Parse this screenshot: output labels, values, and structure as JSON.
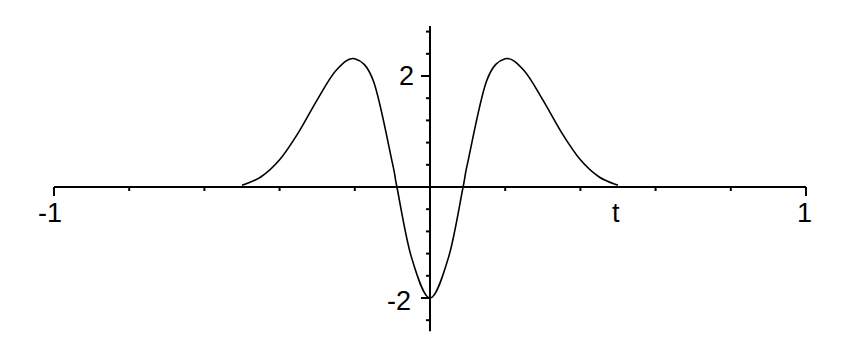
{
  "chart_data": {
    "type": "line",
    "title": "",
    "xlabel": "t",
    "ylabel": "",
    "xlim": [
      -1,
      1
    ],
    "ylim": [
      -2.6,
      2.9
    ],
    "grid": false,
    "legend": null,
    "x_tick_labels": [
      "-1",
      "1"
    ],
    "y_tick_labels": [
      "2",
      "-2"
    ],
    "x_ticks": [
      -1,
      -0.8,
      -0.6,
      -0.4,
      -0.2,
      0,
      0.2,
      0.4,
      0.6,
      0.8,
      1
    ],
    "y_ticks": [
      -2.4,
      -2,
      -1.6,
      -1.2,
      -0.8,
      -0.4,
      0,
      0.4,
      0.8,
      1.2,
      1.6,
      2,
      2.4,
      2.8
    ],
    "series": [
      {
        "name": "f(t)",
        "color": "#000000",
        "x": [
          -0.5,
          -0.45,
          -0.4,
          -0.35,
          -0.3,
          -0.25,
          -0.2,
          -0.15,
          -0.1,
          -0.088,
          -0.05,
          0,
          0.05,
          0.088,
          0.1,
          0.15,
          0.2,
          0.25,
          0.3,
          0.35,
          0.4,
          0.45,
          0.5
        ],
        "y": [
          0.03,
          0.18,
          0.49,
          0.98,
          1.57,
          2.1,
          2.31,
          1.9,
          0.43,
          0.0,
          -1.25,
          -2.0,
          -1.25,
          0.0,
          0.43,
          1.9,
          2.31,
          2.1,
          1.57,
          0.98,
          0.49,
          0.18,
          0.03
        ]
      }
    ]
  },
  "labels": {
    "x_min": "-1",
    "x_max": "1",
    "x_var": "t",
    "y_pos": "2",
    "y_neg": "-2"
  }
}
